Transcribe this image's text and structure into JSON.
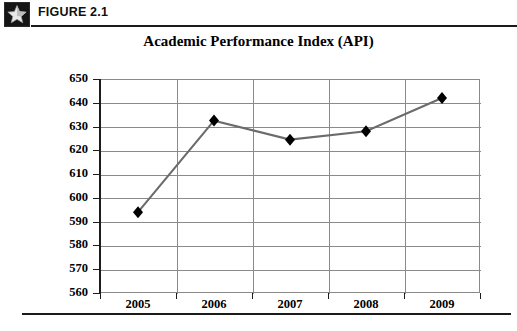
{
  "figure": {
    "icon_name": "star-icon",
    "label": "FIGURE 2.1"
  },
  "chart_data": {
    "type": "line",
    "title": "Academic Performance Index (API)",
    "xlabel": "",
    "ylabel": "",
    "categories": [
      "2005",
      "2006",
      "2007",
      "2008",
      "2009"
    ],
    "values": [
      594,
      632.5,
      624.5,
      628,
      642
    ],
    "ylim": [
      560,
      650
    ],
    "ytick_step": 10,
    "yticks": [
      650,
      640,
      630,
      620,
      610,
      600,
      590,
      580,
      570,
      560
    ],
    "grid": "both",
    "legend": "none",
    "series": [
      {
        "name": "Academic Performance Index (API)",
        "values": [
          594,
          632.5,
          624.5,
          628,
          642
        ]
      }
    ],
    "marker": "diamond",
    "marker_color": "#000000",
    "line_color": "#6b6b6b",
    "grid_color": "#8a8a8a",
    "axis_color": "#1c1c1c"
  }
}
